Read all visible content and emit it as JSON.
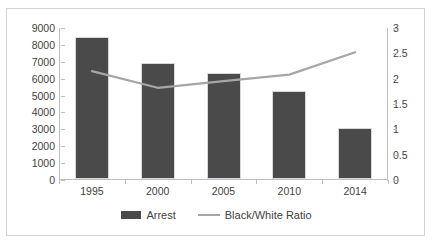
{
  "chart_data": {
    "type": "bar",
    "title": "",
    "xlabel": "",
    "ylabel": "",
    "categories": [
      "1995",
      "2000",
      "2005",
      "2010",
      "2014"
    ],
    "series": [
      {
        "name": "Arrest",
        "type": "bar",
        "axis": "left",
        "color": "#4a4a4a",
        "values": [
          8400,
          6850,
          6250,
          5200,
          3050
        ]
      },
      {
        "name": "Black/White Ratio",
        "type": "line",
        "axis": "right",
        "color": "#a6a6a6",
        "values": [
          2.15,
          1.82,
          1.95,
          2.08,
          2.52
        ]
      }
    ],
    "left_axis": {
      "ylim": [
        0,
        9000
      ],
      "step": 1000,
      "ticks": [
        "0",
        "1000",
        "2000",
        "3000",
        "4000",
        "5000",
        "6000",
        "7000",
        "8000",
        "9000"
      ]
    },
    "right_axis": {
      "ylim": [
        0,
        3
      ],
      "step": 0.5,
      "ticks": [
        "0",
        "0.5",
        "1",
        "1.5",
        "2",
        "2.5",
        "3"
      ]
    },
    "grid": false,
    "legend_position": "bottom",
    "legend": [
      "Arrest",
      "Black/White Ratio"
    ]
  },
  "frame": {
    "clipped_title": ""
  }
}
